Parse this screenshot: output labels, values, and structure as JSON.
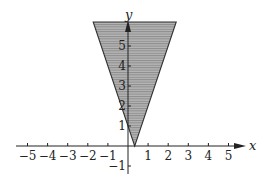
{
  "chart_data": {
    "type": "area",
    "title": "",
    "xlabel": "x",
    "ylabel": "y",
    "xlim": [
      -5.5,
      5.6
    ],
    "ylim": [
      -1.4,
      6.2
    ],
    "x_ticks": [
      -5,
      -4,
      -3,
      -2,
      -1,
      1,
      2,
      3,
      4,
      5
    ],
    "x_tick_labels": [
      "−5",
      "−4",
      "−3",
      "−2",
      "−1",
      "1",
      "2",
      "3",
      "4",
      "5"
    ],
    "y_ticks": [
      -1,
      1,
      2,
      3,
      4,
      5
    ],
    "y_tick_labels": [
      "−1",
      "1",
      "2",
      "3",
      "4",
      "5"
    ],
    "grid": false,
    "legend": null,
    "region": {
      "vertex": [
        0.333,
        0
      ],
      "left_boundary": "y = -3x + 1",
      "right_boundary": "y = 3x - 1",
      "polygon": [
        [
          0.333,
          0
        ],
        [
          -1.73,
          6.2
        ],
        [
          2.4,
          6.2
        ]
      ],
      "fill": "horizontal hatching (gray)"
    },
    "colors": {
      "fill": "#a8a8a8",
      "hatch": "#8a8a8a",
      "axis": "#222222",
      "boundary": "#333333"
    }
  }
}
